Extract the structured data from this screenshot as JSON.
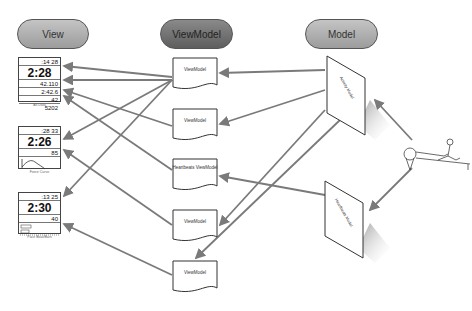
{
  "headers": {
    "view": "View",
    "viewmodel": "ViewModel",
    "model": "Model"
  },
  "views": [
    {
      "caption": "All Data",
      "rows": [
        ":14  28",
        "2:28",
        "42.110",
        "2:42.6",
        "42",
        "5202"
      ]
    },
    {
      "caption": "Force Curve",
      "rows": [
        ":28  33",
        "2:26",
        "85"
      ]
    },
    {
      "caption": "Pace Boat/Bars",
      "rows": [
        ":13  25",
        "2:30",
        "40"
      ]
    }
  ],
  "viewmodels": [
    {
      "label": "ViewModel"
    },
    {
      "label": "ViewModel"
    },
    {
      "label": "Heartbeats ViewModel"
    },
    {
      "label": "ViewModel"
    },
    {
      "label": "ViewModel"
    }
  ],
  "models": [
    {
      "label": "Activity Model"
    },
    {
      "label": "Heartbeats Model"
    }
  ],
  "colors": {
    "arrow": "#7a7a7a",
    "outline": "#444444",
    "pill_light": "#b0b0b0",
    "pill_dark": "#6e6e6e"
  },
  "source_icon": "rowing-machine-icon"
}
